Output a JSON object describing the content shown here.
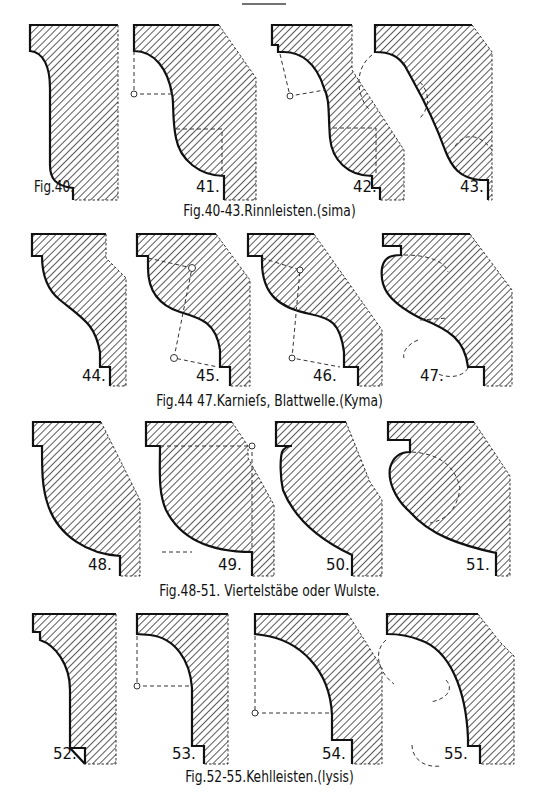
{
  "page": {
    "header_rule": "—"
  },
  "groups": [
    {
      "caption": "Fig.40-43.Rinnleisten.(sima)",
      "figures": [
        {
          "label": "Fig.40.",
          "type": "sima"
        },
        {
          "label": "41.",
          "type": "sima"
        },
        {
          "label": "42.",
          "type": "sima"
        },
        {
          "label": "43.",
          "type": "sima"
        }
      ]
    },
    {
      "caption": "Fig.44 47.Karnieſs, Blattwelle.(Kyma)",
      "figures": [
        {
          "label": "44.",
          "type": "kyma"
        },
        {
          "label": "45.",
          "type": "kyma"
        },
        {
          "label": "46.",
          "type": "kyma"
        },
        {
          "label": "47.",
          "type": "kyma"
        }
      ]
    },
    {
      "caption": "Fig.48-51. Viertelstäbe oder Wulste.",
      "figures": [
        {
          "label": "48.",
          "type": "ovolo"
        },
        {
          "label": "49.",
          "type": "ovolo"
        },
        {
          "label": "50.",
          "type": "ovolo"
        },
        {
          "label": "51.",
          "type": "ovolo"
        }
      ]
    },
    {
      "caption": "Fig.52-55.Kehlleisten.(lysis)",
      "figures": [
        {
          "label": "52.",
          "type": "cavetto"
        },
        {
          "label": "53.",
          "type": "cavetto"
        },
        {
          "label": "54.",
          "type": "cavetto"
        },
        {
          "label": "55.",
          "type": "cavetto"
        }
      ]
    }
  ],
  "colors": {
    "ink": "#111111",
    "paper": "#ffffff"
  }
}
